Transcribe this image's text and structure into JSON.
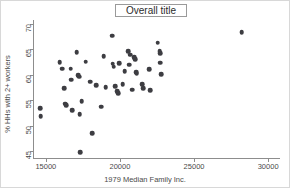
{
  "chart_data": {
    "type": "scatter",
    "title": "Overall title",
    "xlabel": "1979 Median Family Inc.",
    "ylabel": "% HHs with 2+ workers",
    "xlim": [
      14200,
      30800
    ],
    "ylim": [
      43.6,
      70.8
    ],
    "xticks": [
      15000,
      20000,
      25000,
      30000
    ],
    "xtick_labels": [
      "15000",
      "20000",
      "25000",
      "30000"
    ],
    "yticks": [
      45,
      50,
      55,
      60,
      65,
      70
    ],
    "ytick_labels": [
      "45",
      "50",
      "55",
      "60",
      "65",
      "70"
    ],
    "grid": false,
    "legend": null,
    "marker": {
      "shape": "circle",
      "color": "#3d3d42",
      "size": 4.6
    },
    "points": [
      {
        "x": 14620,
        "y": 53.4
      },
      {
        "x": 14640,
        "y": 51.8
      },
      {
        "x": 15940,
        "y": 62.5
      },
      {
        "x": 16100,
        "y": 61.2
      },
      {
        "x": 16230,
        "y": 57.4
      },
      {
        "x": 16300,
        "y": 54.3
      },
      {
        "x": 16380,
        "y": 54.0
      },
      {
        "x": 16690,
        "y": 61.2
      },
      {
        "x": 16710,
        "y": 59.0
      },
      {
        "x": 16760,
        "y": 53.0
      },
      {
        "x": 17080,
        "y": 64.4
      },
      {
        "x": 17180,
        "y": 59.9
      },
      {
        "x": 17250,
        "y": 59.6
      },
      {
        "x": 17280,
        "y": 52.2
      },
      {
        "x": 17320,
        "y": 44.8
      },
      {
        "x": 17420,
        "y": 54.8
      },
      {
        "x": 17680,
        "y": 62.6
      },
      {
        "x": 17990,
        "y": 58.6
      },
      {
        "x": 18120,
        "y": 48.5
      },
      {
        "x": 18410,
        "y": 58.0
      },
      {
        "x": 18730,
        "y": 53.7
      },
      {
        "x": 18900,
        "y": 63.7
      },
      {
        "x": 19050,
        "y": 57.5
      },
      {
        "x": 19480,
        "y": 67.7
      },
      {
        "x": 19520,
        "y": 62.2
      },
      {
        "x": 19570,
        "y": 61.6
      },
      {
        "x": 19680,
        "y": 57.7
      },
      {
        "x": 19830,
        "y": 56.8
      },
      {
        "x": 19880,
        "y": 56.4
      },
      {
        "x": 19960,
        "y": 62.3
      },
      {
        "x": 20190,
        "y": 58.2
      },
      {
        "x": 20310,
        "y": 60.7
      },
      {
        "x": 20560,
        "y": 64.6
      },
      {
        "x": 20620,
        "y": 62.0
      },
      {
        "x": 20680,
        "y": 64.0
      },
      {
        "x": 20810,
        "y": 57.1
      },
      {
        "x": 20980,
        "y": 63.5
      },
      {
        "x": 21020,
        "y": 63.1
      },
      {
        "x": 21090,
        "y": 60.5
      },
      {
        "x": 21140,
        "y": 60.2
      },
      {
        "x": 21520,
        "y": 58.2
      },
      {
        "x": 21570,
        "y": 57.3
      },
      {
        "x": 21980,
        "y": 61.1
      },
      {
        "x": 22050,
        "y": 57.0
      },
      {
        "x": 22550,
        "y": 66.3
      },
      {
        "x": 22680,
        "y": 64.7
      },
      {
        "x": 22700,
        "y": 64.3
      },
      {
        "x": 22730,
        "y": 62.4
      },
      {
        "x": 22790,
        "y": 60.1
      },
      {
        "x": 28220,
        "y": 68.4
      }
    ]
  }
}
